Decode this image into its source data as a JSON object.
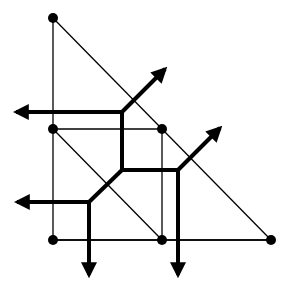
{
  "diagram": {
    "type": "voronoi-delaunay-overlay",
    "width": 287,
    "height": 289,
    "colors": {
      "background": "#ffffff",
      "ink": "#000000"
    },
    "sites": [
      {
        "id": "A",
        "x": 53,
        "y": 18
      },
      {
        "id": "B",
        "x": 53,
        "y": 129
      },
      {
        "id": "C",
        "x": 162,
        "y": 129
      },
      {
        "id": "D",
        "x": 53,
        "y": 240
      },
      {
        "id": "E",
        "x": 162,
        "y": 240
      },
      {
        "id": "F",
        "x": 271,
        "y": 240
      }
    ],
    "delaunay_edges": [
      [
        "A",
        "B"
      ],
      [
        "B",
        "D"
      ],
      [
        "A",
        "F"
      ],
      [
        "D",
        "F"
      ],
      [
        "B",
        "C"
      ],
      [
        "C",
        "E"
      ],
      [
        "B",
        "E"
      ],
      [
        "D",
        "E"
      ],
      [
        "E",
        "F"
      ]
    ],
    "voronoi_vertices": [
      {
        "id": "v1",
        "x": 122,
        "y": 112
      },
      {
        "id": "v2",
        "x": 122,
        "y": 170
      },
      {
        "id": "v3",
        "x": 178,
        "y": 170
      },
      {
        "id": "v4",
        "x": 89,
        "y": 202
      }
    ],
    "voronoi_segments": [
      [
        "v1",
        "v2"
      ],
      [
        "v2",
        "v3"
      ],
      [
        "v2",
        "v4"
      ]
    ],
    "voronoi_rays": [
      {
        "from": "v1",
        "to_x": 16,
        "to_y": 112,
        "direction": "left"
      },
      {
        "from": "v1",
        "to_x": 165,
        "to_y": 69,
        "direction": "up-right"
      },
      {
        "from": "v3",
        "to_x": 220,
        "to_y": 128,
        "direction": "up-right"
      },
      {
        "from": "v3",
        "to_x": 178,
        "to_y": 275,
        "direction": "down"
      },
      {
        "from": "v4",
        "to_x": 17,
        "to_y": 202,
        "direction": "left"
      },
      {
        "from": "v4",
        "to_x": 89,
        "to_y": 275,
        "direction": "down"
      }
    ]
  }
}
